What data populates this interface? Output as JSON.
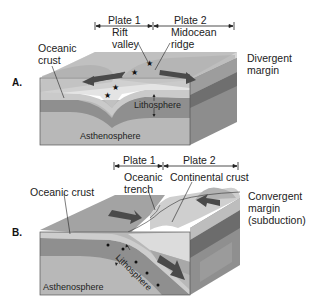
{
  "panel_a": {
    "tag": "A.",
    "plate1": "Plate 1",
    "plate2": "Plate 2",
    "rift_valley_line1": "Rift",
    "rift_valley_line2": "valley",
    "midocean_line1": "Midocean",
    "midocean_line2": "ridge",
    "oceanic_crust_line1": "Oceanic",
    "oceanic_crust_line2": "crust",
    "lithosphere": "Lithosphere",
    "asthenosphere": "Asthenosphere",
    "margin_line1": "Divergent",
    "margin_line2": "margin"
  },
  "panel_b": {
    "tag": "B.",
    "plate1": "Plate 1",
    "plate2": "Plate 2",
    "trench_line1": "Oceanic",
    "trench_line2": "trench",
    "continental_crust": "Continental crust",
    "oceanic_crust": "Oceanic crust",
    "lithosphere": "Lithosphere",
    "asthenosphere": "Asthenosphere",
    "margin_line1": "Convergent",
    "margin_line2": "margin",
    "margin_line3": "(subduction)"
  },
  "colors": {
    "surface": "#a9a9a9",
    "surface_light": "#cfcfcf",
    "crust": "#c4c4c4",
    "lithosphere": "#8f8f8f",
    "asthenosphere": "#b8b8b8",
    "side_dark": "#7a7a7a",
    "arrow": "#4a4a4a",
    "continental": "#dedede"
  }
}
